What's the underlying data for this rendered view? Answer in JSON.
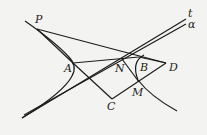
{
  "figure": {
    "labels": {
      "P": "P",
      "A": "A",
      "N": "N",
      "B": "B",
      "D": "D",
      "M": "M",
      "C": "C",
      "t": "t",
      "a": "α"
    },
    "colors": {
      "stroke": "#1c1c1c",
      "background": "#f3f3f1"
    }
  }
}
